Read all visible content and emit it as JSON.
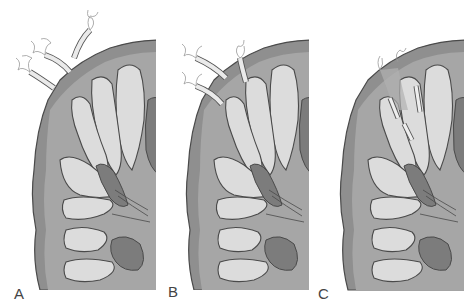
{
  "figure": {
    "panels": [
      {
        "id": "A",
        "label": "A",
        "description": "Bacteria attaching to mucosal surface",
        "left": 0
      },
      {
        "id": "B",
        "label": "B",
        "description": "Bacteria invading crypts/ducts",
        "left": 154
      },
      {
        "id": "C",
        "label": "C",
        "description": "Bacteria deep within ducts",
        "left": 308
      }
    ]
  },
  "colors": {
    "background": "#ffffff",
    "outer_tissue": "#8c8c8c",
    "tissue_mid": "#a9a9a9",
    "lobule_fill": "#dcdcdc",
    "lobule_highlight": "#ececec",
    "dark_core": "#7a7a7a",
    "outline": "#4a4a4a",
    "bacteria": "#e8e8e8"
  }
}
